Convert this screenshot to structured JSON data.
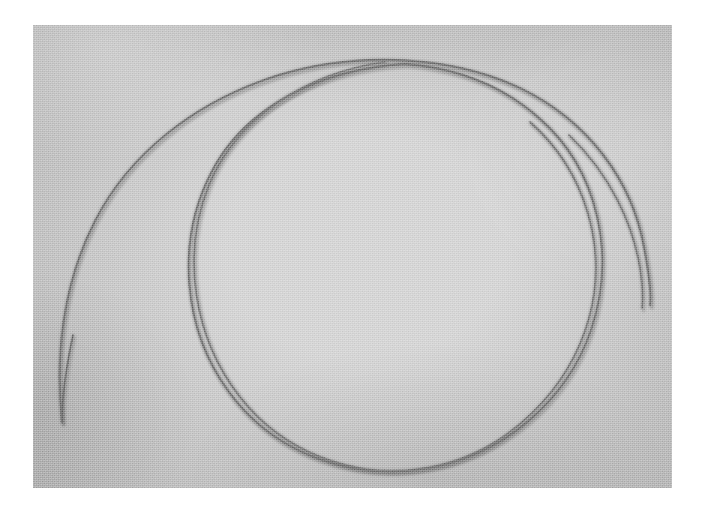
{
  "scene": {
    "subject": "coiled wire filament",
    "description": "Close-up photograph of a thin dark wire loosely coiled into roughly one and a half overlapping circular loops, resting on a flat light-gray granular surface.",
    "border_color": "#ffffff",
    "surface_color_center": "#d2d2d2",
    "surface_color_edge": "#a9a9a9",
    "wire_color": "#6f6f6f",
    "wire_highlight_color": "#9a9a9a",
    "frame": {
      "width": 707,
      "height": 518
    },
    "photo_area": {
      "x": 33,
      "y": 25,
      "width": 639,
      "height": 463
    }
  },
  "wire_strands": [
    {
      "name": "outer-loop",
      "note": "Large outer arc. Free end at lower left, sweeps up and over the top, down the right side, ending at the lower right free tip.",
      "free_end_start": {
        "x": 29,
        "y": 397
      },
      "free_end_finish": {
        "x": 617,
        "y": 280
      },
      "stroke_width": 1.9,
      "path": "M 29,397 C 22,330 30,258 62,196 C 96,129 162,76 246,50 C 330,25 421,32 487,63 C 556,96 599,156 611,222 C 618,259 618,272 617,280"
    },
    {
      "name": "inner-loop",
      "note": "Inner circular loop nested inside the outer one, crossing the outer loop near the top and near the bottom.",
      "stroke_width": 1.8,
      "path": "M 372,39 C 288,44 213,81 179,146 C 142,216 150,305 196,367 C 243,431 322,456 395,443 C 470,430 534,376 558,305 C 583,231 566,145 506,93 C 470,61 424,43 372,39"
    },
    {
      "name": "middle-loop",
      "note": "Second pass of the coil that runs nearly parallel to the inner loop along the upper right and bottom, separating slightly on the right flank.",
      "stroke_width": 1.7,
      "path": "M 352,37 C 272,48 203,94 176,160 C 148,229 160,312 207,372 C 254,432 334,458 404,441 C 476,424 536,365 556,293 C 575,224 553,146 497,97"
    },
    {
      "name": "right-tail",
      "note": "Short tail segment of the coil on the far right that curves down and terminates in a blunt free tip.",
      "free_end": {
        "x": 609,
        "y": 283
      },
      "stroke_width": 1.7,
      "path": "M 536,110 C 578,150 600,200 607,243 C 610,263 610,274 609,283"
    },
    {
      "name": "lower-left-tail",
      "note": "Straightening lower-left tail of the outer arc, ending bluntly below the loop.",
      "free_end": {
        "x": 29,
        "y": 397
      },
      "stroke_width": 1.7,
      "path": "M 40,310 C 33,343 29,372 29,397"
    }
  ],
  "crossings": [
    {
      "name": "top-crossing",
      "x": 372,
      "y": 42
    },
    {
      "name": "bottom-crossing",
      "x": 357,
      "y": 432
    },
    {
      "name": "upper-right-tangency",
      "x": 540,
      "y": 120
    }
  ]
}
